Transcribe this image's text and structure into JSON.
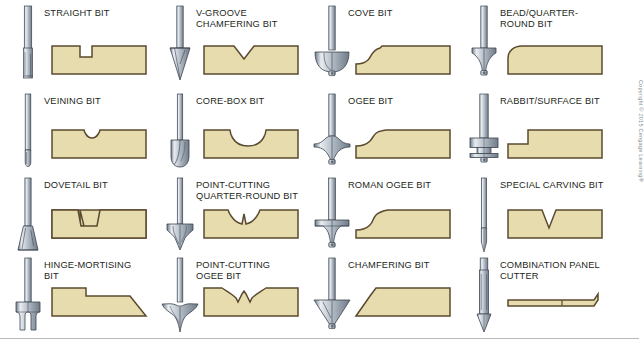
{
  "figure": {
    "copyright": "Copyright © 2015 Cengage Learning®",
    "colors": {
      "wood_fill": "#e6dcae",
      "wood_outline": "#5b4a2f",
      "steel_light": "#e9edf1",
      "steel_mid": "#b3bcc6",
      "steel_dark": "#6f7b88",
      "outline": "#3c4450",
      "label_text": "#231f20",
      "page_background": "#ffffff",
      "rule": "#b9b9b9"
    },
    "layout": {
      "columns": 4,
      "rows": 4,
      "items_total": 16
    }
  },
  "bits": [
    {
      "id": "straight",
      "label": "STRAIGHT BIT",
      "art": "straight",
      "profile": "square-groove"
    },
    {
      "id": "v-groove-chamfering",
      "label": "V-GROOVE CHAMFERING BIT",
      "art": "v-groove",
      "profile": "v-groove"
    },
    {
      "id": "cove",
      "label": "COVE BIT",
      "art": "cove",
      "profile": "cove-edge"
    },
    {
      "id": "bead-quarter-round",
      "label": "BEAD/QUARTER-ROUND BIT",
      "art": "bead",
      "profile": "round-over-edge"
    },
    {
      "id": "veining",
      "label": "VEINING BIT",
      "art": "veining",
      "profile": "small-round-groove"
    },
    {
      "id": "core-box",
      "label": "CORE-BOX BIT",
      "art": "core-box",
      "profile": "cove-groove"
    },
    {
      "id": "ogee",
      "label": "OGEE BIT",
      "art": "ogee",
      "profile": "ogee-edge"
    },
    {
      "id": "rabbit-surface",
      "label": "RABBIT/SURFACE BIT",
      "art": "rabbit",
      "profile": "rabbet-edge"
    },
    {
      "id": "dovetail",
      "label": "DOVETAIL BIT",
      "art": "dovetail",
      "profile": "dovetail-groove"
    },
    {
      "id": "point-cutting-quarter",
      "label": "POINT-CUTTING QUARTER-ROUND BIT",
      "art": "pc-quarter",
      "profile": "double-cove-point-groove"
    },
    {
      "id": "roman-ogee",
      "label": "ROMAN OGEE BIT",
      "art": "roman-ogee",
      "profile": "roman-ogee-edge"
    },
    {
      "id": "special-carving",
      "label": "SPECIAL CARVING BIT",
      "art": "carving",
      "profile": "narrow-v-groove"
    },
    {
      "id": "hinge-mortising",
      "label": "HINGE-MORTISING BIT",
      "art": "hinge",
      "profile": "mortise-step"
    },
    {
      "id": "point-cutting-ogee",
      "label": "POINT-CUTTING OGEE BIT",
      "art": "pc-ogee",
      "profile": "ogee-point-groove"
    },
    {
      "id": "chamfering",
      "label": "CHAMFERING BIT",
      "art": "chamfer",
      "profile": "chamfer-edge"
    },
    {
      "id": "combination-panel",
      "label": "COMBINATION PANEL CUTTER",
      "art": "combination",
      "profile": "panel-slot"
    }
  ]
}
